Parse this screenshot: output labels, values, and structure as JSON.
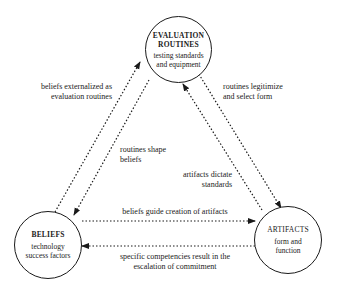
{
  "nodes": {
    "evaluation": {
      "title_line1": "EVALUATION",
      "title_line2": "ROUTINES",
      "sub_line1": "testing standards",
      "sub_line2": "and equipment"
    },
    "beliefs": {
      "title": "BELIEFS",
      "sub_line1": "technology",
      "sub_line2": "success factors"
    },
    "artifacts": {
      "title": "ARTIFACTS",
      "sub_line1": "form and",
      "sub_line2": "function"
    }
  },
  "edges": {
    "beliefs_to_evaluation": {
      "line1": "beliefs externalized as",
      "line2": "evaluation routines"
    },
    "evaluation_to_beliefs": {
      "line1": "routines shape",
      "line2": "beliefs"
    },
    "evaluation_to_artifacts": {
      "line1": "routines legitimize",
      "line2": "and select form"
    },
    "artifacts_to_evaluation": {
      "line1": "artifacts dictate",
      "line2": "standards"
    },
    "beliefs_to_artifacts": {
      "line1": "beliefs guide creation of artifacts"
    },
    "artifacts_to_beliefs": {
      "line1": "specific competencies result in the",
      "line2": "escalation of commitment"
    }
  },
  "colors": {
    "stroke": "#1a1a1a",
    "background": "#ffffff"
  }
}
